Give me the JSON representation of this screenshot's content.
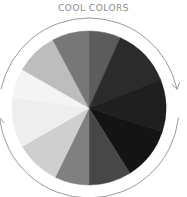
{
  "diagram": {
    "label_top": "COOL COLORS",
    "center": {
      "x": 89,
      "y": 108
    },
    "radius": 77,
    "ring_radius": 90,
    "ring_color": "#9a9a9a",
    "segments": [
      {
        "start": 0,
        "end": 24,
        "color": "#5c5c5c"
      },
      {
        "start": 24,
        "end": 68,
        "color": "#2b2b2b"
      },
      {
        "start": 68,
        "end": 108,
        "color": "#1f1f1f"
      },
      {
        "start": 108,
        "end": 148,
        "color": "#141414"
      },
      {
        "start": 148,
        "end": 180,
        "color": "#474747"
      },
      {
        "start": 180,
        "end": 206,
        "color": "#808080"
      },
      {
        "start": 206,
        "end": 240,
        "color": "#cfcfcf"
      },
      {
        "start": 240,
        "end": 278,
        "color": "#eeeeee"
      },
      {
        "start": 278,
        "end": 300,
        "color": "#f4f4f4"
      },
      {
        "start": 300,
        "end": 332,
        "color": "#bdbdbd"
      },
      {
        "start": 332,
        "end": 360,
        "color": "#777777"
      }
    ],
    "arrows": [
      {
        "name": "top-arc",
        "from": 282,
        "to": 78,
        "direction": "clockwise"
      },
      {
        "name": "bottom-arc",
        "from": 96,
        "to": 264,
        "direction": "clockwise"
      }
    ]
  }
}
